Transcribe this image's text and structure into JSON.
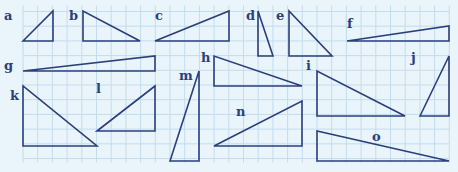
{
  "colors": {
    "background": "#e9f4fb",
    "grid": "#c4dcee",
    "stroke": "#2b3f7c",
    "label": "#2b3f7c"
  },
  "grid": {
    "x0": 23,
    "y0": 11.5,
    "cell": 14.7,
    "cols": 29,
    "rows": 10
  },
  "triangles": [
    {
      "label": "a",
      "points": [
        [
          23,
          41
        ],
        [
          53,
          11
        ],
        [
          53,
          41
        ]
      ],
      "label_pos": [
        4,
        20
      ]
    },
    {
      "label": "b",
      "points": [
        [
          83,
          11
        ],
        [
          83,
          41
        ],
        [
          140,
          41
        ]
      ],
      "label_pos": [
        69,
        20
      ]
    },
    {
      "label": "c",
      "points": [
        [
          155,
          41
        ],
        [
          229,
          11
        ],
        [
          229,
          41
        ]
      ],
      "label_pos": [
        155,
        20
      ]
    },
    {
      "label": "d",
      "points": [
        [
          258,
          11
        ],
        [
          258,
          56
        ],
        [
          273,
          56
        ]
      ],
      "label_pos": [
        246,
        20
      ]
    },
    {
      "label": "e",
      "points": [
        [
          289,
          11
        ],
        [
          289,
          56
        ],
        [
          332,
          56
        ]
      ],
      "label_pos": [
        276,
        20
      ]
    },
    {
      "label": "f",
      "points": [
        [
          347,
          41
        ],
        [
          449,
          26
        ],
        [
          449,
          41
        ]
      ],
      "label_pos": [
        347,
        28
      ]
    },
    {
      "label": "g",
      "points": [
        [
          23,
          71
        ],
        [
          155,
          56
        ],
        [
          155,
          71
        ]
      ],
      "label_pos": [
        4,
        70
      ]
    },
    {
      "label": "h",
      "points": [
        [
          214,
          56
        ],
        [
          214,
          86
        ],
        [
          302,
          86
        ]
      ],
      "label_pos": [
        201,
        62
      ]
    },
    {
      "label": "i",
      "points": [
        [
          317,
          71
        ],
        [
          317,
          116
        ],
        [
          405,
          116
        ]
      ],
      "label_pos": [
        306,
        70
      ]
    },
    {
      "label": "j",
      "points": [
        [
          420,
          116
        ],
        [
          449,
          56
        ],
        [
          449,
          116
        ]
      ],
      "label_pos": [
        411,
        62
      ]
    },
    {
      "label": "k",
      "points": [
        [
          23,
          86
        ],
        [
          23,
          146
        ],
        [
          97,
          146
        ]
      ],
      "label_pos": [
        10,
        100
      ]
    },
    {
      "label": "l",
      "points": [
        [
          97,
          131
        ],
        [
          155,
          86
        ],
        [
          155,
          131
        ]
      ],
      "label_pos": [
        96,
        93
      ]
    },
    {
      "label": "m",
      "points": [
        [
          170,
          161
        ],
        [
          199,
          71
        ],
        [
          199,
          161
        ]
      ],
      "label_pos": [
        179,
        80
      ]
    },
    {
      "label": "n",
      "points": [
        [
          214,
          146
        ],
        [
          302,
          101
        ],
        [
          302,
          146
        ]
      ],
      "label_pos": [
        236,
        116
      ]
    },
    {
      "label": "o",
      "points": [
        [
          317,
          131
        ],
        [
          317,
          161
        ],
        [
          449,
          161
        ]
      ],
      "label_pos": [
        372,
        141
      ]
    }
  ]
}
